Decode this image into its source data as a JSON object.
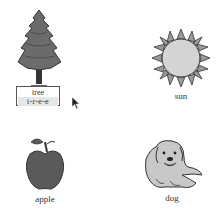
{
  "cards": [
    {
      "id": "tree",
      "label": "tree",
      "spelling": "t-r-e-e",
      "selected": true
    },
    {
      "id": "sun",
      "label": "sun"
    },
    {
      "id": "apple",
      "label": "apple"
    },
    {
      "id": "dog",
      "label": "dog"
    }
  ],
  "colors": {
    "foliage": "#6b6b6b",
    "sun_fill": "#d4d4d4",
    "sun_rays": "#9a9a9a",
    "apple": "#5a5a5a",
    "dog": "#c8c8c8",
    "outline": "#333333"
  }
}
